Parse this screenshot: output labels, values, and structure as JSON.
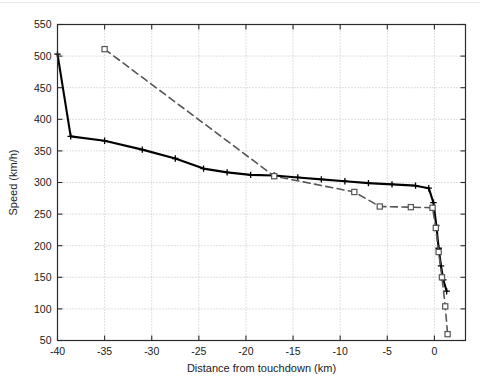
{
  "figure": {
    "background_color": "#ffffff",
    "axis_color": "#2b2b2b",
    "grid_color": "#b9b9b9",
    "series_solid_color": "#000000",
    "series_dashed_color": "#555555"
  },
  "chart_data": {
    "type": "line",
    "title": "",
    "xlabel": "Distance from touchdown (km)",
    "ylabel": "Speed (km/h)",
    "xlim": [
      -40,
      3.3
    ],
    "ylim": [
      50,
      550
    ],
    "xticks": [
      -40,
      -35,
      -30,
      -25,
      -20,
      -15,
      -10,
      -5,
      0
    ],
    "xtick_labels": [
      "-40",
      "-35",
      "-30",
      "-25",
      "-20",
      "-15",
      "-10",
      "-5",
      "0"
    ],
    "yticks": [
      50,
      100,
      150,
      200,
      250,
      300,
      350,
      400,
      450,
      500,
      550
    ],
    "ytick_labels": [
      "50",
      "100",
      "150",
      "200",
      "250",
      "300",
      "350",
      "400",
      "450",
      "500",
      "550"
    ],
    "grid": true,
    "grid_style": "dotted",
    "legend": null,
    "series": [
      {
        "name": "solid-profile",
        "style": "solid",
        "marker": "plus",
        "color": "#000000",
        "x": [
          -40.0,
          -38.6,
          -35.0,
          -31.0,
          -27.5,
          -24.5,
          -22.0,
          -19.5,
          -17.0,
          -14.5,
          -12.0,
          -9.5,
          -7.0,
          -4.5,
          -2.0,
          -0.6,
          -0.1,
          0.2,
          0.45,
          0.7,
          0.95,
          1.3
        ],
        "y": [
          503,
          373,
          366,
          352,
          338,
          322,
          316,
          312,
          311,
          308,
          305,
          302,
          299,
          297,
          295,
          291,
          268,
          232,
          196,
          168,
          146,
          128
        ]
      },
      {
        "name": "dashed-profile",
        "style": "dashed",
        "marker": "square",
        "color": "#555555",
        "x": [
          -35.0,
          -17.0,
          -8.5,
          -5.8,
          -2.5,
          -0.2,
          0.15,
          0.45,
          0.8,
          1.15,
          1.4
        ],
        "y": [
          511,
          310,
          285,
          262,
          261,
          260,
          228,
          190,
          150,
          104,
          60
        ]
      }
    ]
  }
}
